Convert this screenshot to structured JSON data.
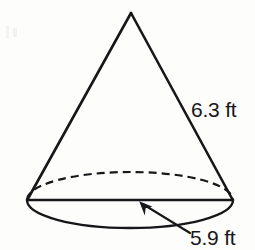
{
  "figure": {
    "kind": "geometry-diagram",
    "shape": "cone",
    "background_color": "#fdfdfc",
    "stroke_color": "#17171a",
    "text_color": "#17171a",
    "labels": {
      "slant_height": "6.3 ft",
      "base_diameter": "5.9 ft"
    },
    "measurements": [
      {
        "name": "slant-height",
        "value": 6.3,
        "unit": "ft",
        "label": "6.3 ft"
      },
      {
        "name": "base-diameter",
        "value": 5.9,
        "unit": "ft",
        "label": "5.9 ft"
      }
    ],
    "geometry": {
      "apex": {
        "x": 131,
        "y": 12
      },
      "base_ellipse": {
        "cx": 130,
        "cy": 200,
        "rx": 103,
        "ry": 28
      },
      "left_base_point": {
        "x": 27,
        "y": 200
      },
      "right_base_point": {
        "x": 233,
        "y": 200
      },
      "hidden_edge_style": "dashed",
      "leader_arrow": {
        "tip": {
          "x": 140,
          "y": 202
        },
        "tail": {
          "x": 190,
          "y": 233
        }
      }
    }
  }
}
